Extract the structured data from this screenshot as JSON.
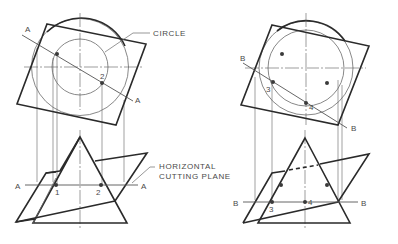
{
  "figure": {
    "labels": {
      "circle": "CIRCLE",
      "horizontal_line1": "HORIZONTAL",
      "horizontal_line2": "CUTTING PLANE"
    },
    "left_view": {
      "cutting_line_label": "A",
      "points": [
        "1",
        "2"
      ]
    },
    "right_view": {
      "cutting_line_label": "B",
      "points": [
        "3",
        "4"
      ]
    },
    "colors": {
      "object_line": "#2a2a2a",
      "construction_line": "#6a6a6a",
      "text": "#4a4a4a"
    }
  }
}
